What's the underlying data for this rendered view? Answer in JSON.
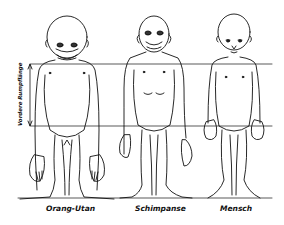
{
  "figure": {
    "measure_label": "Vordere Rumpflänge",
    "subjects": [
      {
        "id": "orang",
        "label": "Orang-Utan"
      },
      {
        "id": "chimp",
        "label": "Schimpanse"
      },
      {
        "id": "human",
        "label": "Mensch"
      }
    ],
    "colors": {
      "line": "#111111",
      "background": "#ffffff"
    }
  }
}
